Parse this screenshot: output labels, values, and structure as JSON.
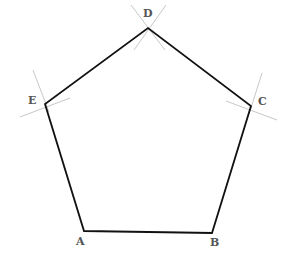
{
  "diagram": {
    "type": "regular-pentagon-construction",
    "colors": {
      "edge": "#111111",
      "arc": "#c8c8c8",
      "label": "#555555",
      "background": "#ffffff"
    },
    "vertices": [
      {
        "name": "A",
        "x": 84,
        "y": 231,
        "label_x": 76,
        "label_y": 236
      },
      {
        "name": "B",
        "x": 212,
        "y": 233,
        "label_x": 210,
        "label_y": 237
      },
      {
        "name": "C",
        "x": 251,
        "y": 106,
        "label_x": 258,
        "label_y": 96
      },
      {
        "name": "D",
        "x": 148,
        "y": 28,
        "label_x": 143,
        "label_y": 8
      },
      {
        "name": "E",
        "x": 45,
        "y": 104,
        "label_x": 28,
        "label_y": 95
      }
    ],
    "construction_arcs": [
      {
        "at": "D",
        "x1": 131,
        "y1": 5,
        "x2": 165,
        "y2": 50
      },
      {
        "at": "D",
        "x1": 166,
        "y1": 5,
        "x2": 134,
        "y2": 50
      },
      {
        "at": "E",
        "x1": 33,
        "y1": 70,
        "x2": 49,
        "y2": 112
      },
      {
        "at": "E",
        "x1": 20,
        "y1": 117,
        "x2": 70,
        "y2": 98
      },
      {
        "at": "C",
        "x1": 262,
        "y1": 73,
        "x2": 249,
        "y2": 114
      },
      {
        "at": "C",
        "x1": 226,
        "y1": 101,
        "x2": 277,
        "y2": 120
      }
    ],
    "labels": {
      "A": "A",
      "B": "B",
      "C": "C",
      "D": "D",
      "E": "E"
    }
  }
}
